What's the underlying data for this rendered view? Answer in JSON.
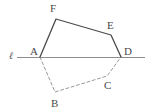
{
  "figure": {
    "canvas": {
      "width": 149,
      "height": 112,
      "background": "#ffffff"
    },
    "colors": {
      "solid_stroke": "#4a4a4a",
      "dashed_stroke": "#9a9a9a",
      "axis_stroke": "#8d8d8d",
      "label_text": "#4a4a4a"
    },
    "line": {
      "name": "l",
      "label": "ℓ",
      "label_x": 9,
      "label_y": 51,
      "x1": 17,
      "y1": 57,
      "x2": 145,
      "y2": 57,
      "stroke_width": 1
    },
    "vertices": [
      {
        "id": "A",
        "label": "A",
        "x": 40,
        "y": 57,
        "label_x": 30,
        "label_y": 46
      },
      {
        "id": "B",
        "label": "B",
        "x": 55,
        "y": 92,
        "label_x": 51,
        "label_y": 98
      },
      {
        "id": "C",
        "label": "C",
        "x": 107,
        "y": 76,
        "label_x": 104,
        "label_y": 80
      },
      {
        "id": "D",
        "label": "D",
        "x": 121,
        "y": 57,
        "label_x": 124,
        "label_y": 46
      },
      {
        "id": "E",
        "label": "E",
        "x": 111,
        "y": 35,
        "label_x": 107,
        "label_y": 20
      },
      {
        "id": "F",
        "label": "F",
        "x": 56,
        "y": 19,
        "label_x": 50,
        "label_y": 3
      }
    ],
    "edges": [
      {
        "name": "edge-A-F",
        "from": "A",
        "to": "F",
        "style": "solid"
      },
      {
        "name": "edge-F-E",
        "from": "F",
        "to": "E",
        "style": "solid"
      },
      {
        "name": "edge-E-D",
        "from": "E",
        "to": "D",
        "style": "solid"
      },
      {
        "name": "edge-A-B",
        "from": "A",
        "to": "B",
        "style": "dashed"
      },
      {
        "name": "edge-B-C",
        "from": "B",
        "to": "C",
        "style": "dashed"
      },
      {
        "name": "edge-C-D",
        "from": "C",
        "to": "D",
        "style": "dashed"
      }
    ]
  }
}
